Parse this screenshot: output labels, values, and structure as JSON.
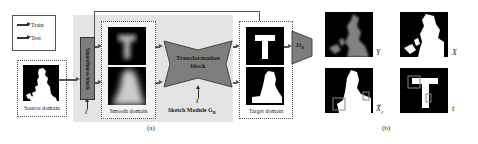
{
  "legend": {
    "items": [
      {
        "label": "Train"
      },
      {
        "label": "Test"
      }
    ]
  },
  "panel_a": {
    "source_domain": {
      "label": "Source domain"
    },
    "smoothness_block": {
      "label": "Smoothness block"
    },
    "smooth_domain": {
      "label": "Smooth domain"
    },
    "transformation_block": {
      "line1": "Transformation",
      "line2": "block"
    },
    "sketch_module": {
      "label": "Sketch Module G",
      "subscript": "B"
    },
    "target_domain": {
      "label": "Target domain"
    },
    "discriminator": {
      "label": "D",
      "subscript": "B"
    },
    "ell_symbol": "ℓ",
    "caption": "(a)"
  },
  "panel_b": {
    "images": [
      {
        "label": "Y"
      },
      {
        "label": "X"
      },
      {
        "label": "X̃",
        "subscript": "ℓ"
      },
      {
        "label": "t"
      }
    ],
    "caption": "(b)"
  },
  "colors": {
    "block_gray": "#7d7d7d",
    "module_bg": "#e4e4e4",
    "arrow": "#555555"
  }
}
